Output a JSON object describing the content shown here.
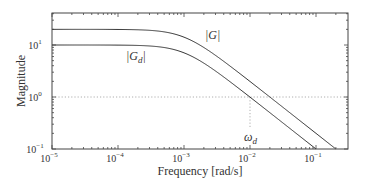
{
  "chart_data": {
    "type": "line",
    "scale": {
      "x": "log",
      "y": "log"
    },
    "xlabel": "Frequency [rad/s]",
    "ylabel": "Magnitude",
    "xlim": [
      1e-05,
      0.3
    ],
    "ylim": [
      0.1,
      40
    ],
    "x_ticks": [
      {
        "base": "10",
        "exp": "-5",
        "value": 1e-05
      },
      {
        "base": "10",
        "exp": "-4",
        "value": 0.0001
      },
      {
        "base": "10",
        "exp": "-3",
        "value": 0.001
      },
      {
        "base": "10",
        "exp": "-2",
        "value": 0.01
      },
      {
        "base": "10",
        "exp": "-1",
        "value": 0.1
      }
    ],
    "y_ticks": [
      {
        "base": "10",
        "exp": "1",
        "value": 10
      },
      {
        "base": "10",
        "exp": "0",
        "value": 1
      },
      {
        "base": "10",
        "exp": "-1",
        "value": 0.1
      }
    ],
    "grid": false,
    "series": [
      {
        "name": "|G|",
        "label": "|G|",
        "gain": 20,
        "corner": 0.001,
        "x": [
          1e-05,
          0.0001,
          0.001,
          0.01,
          0.02,
          0.1,
          0.2
        ],
        "values": [
          20,
          19.9,
          14.1,
          1.99,
          1.0,
          0.2,
          0.1
        ]
      },
      {
        "name": "|Gd|",
        "label": "|G",
        "label_sub": "d",
        "gain": 10,
        "corner": 0.001,
        "x": [
          1e-05,
          0.0001,
          0.001,
          0.01,
          0.1
        ],
        "values": [
          10,
          9.95,
          7.07,
          1.0,
          0.1
        ]
      }
    ],
    "reference_lines": [
      {
        "type": "horizontal",
        "y": 1,
        "style": "dotted"
      },
      {
        "type": "vertical",
        "x": 0.01,
        "y_from": 0.1,
        "y_to": 1,
        "style": "dotted"
      }
    ],
    "annotations": [
      {
        "text": "ω",
        "sub": "d",
        "x": 0.01,
        "meaning": "omega_d"
      }
    ],
    "legend": "inline labels"
  }
}
